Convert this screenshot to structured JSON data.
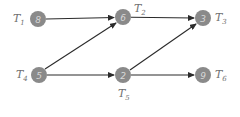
{
  "diagram": {
    "type": "task-dependency-graph",
    "nodes": [
      {
        "id": "T1",
        "label_main": "T",
        "label_sub": "1",
        "value": "8",
        "x": 38,
        "y": 19,
        "label_pos": "left"
      },
      {
        "id": "T2",
        "label_main": "T",
        "label_sub": "2",
        "value": "6",
        "x": 123,
        "y": 17,
        "label_pos": "top-right"
      },
      {
        "id": "T3",
        "label_main": "T",
        "label_sub": "3",
        "value": "3",
        "x": 203,
        "y": 18,
        "label_pos": "right"
      },
      {
        "id": "T4",
        "label_main": "T",
        "label_sub": "4",
        "value": "5",
        "x": 39,
        "y": 75,
        "label_pos": "left"
      },
      {
        "id": "T5",
        "label_main": "T",
        "label_sub": "5",
        "value": "2",
        "x": 123,
        "y": 75,
        "label_pos": "bottom"
      },
      {
        "id": "T6",
        "label_main": "T",
        "label_sub": "6",
        "value": "9",
        "x": 203,
        "y": 75,
        "label_pos": "right"
      }
    ],
    "edges": [
      {
        "from": "T1",
        "to": "T2"
      },
      {
        "from": "T4",
        "to": "T2"
      },
      {
        "from": "T2",
        "to": "T3"
      },
      {
        "from": "T4",
        "to": "T5"
      },
      {
        "from": "T5",
        "to": "T3"
      },
      {
        "from": "T5",
        "to": "T6"
      }
    ],
    "colors": {
      "node_fill": "#8a8a8a",
      "node_text": "#d8d8d8",
      "edge": "#2b2b2b",
      "label": "#707070"
    }
  }
}
